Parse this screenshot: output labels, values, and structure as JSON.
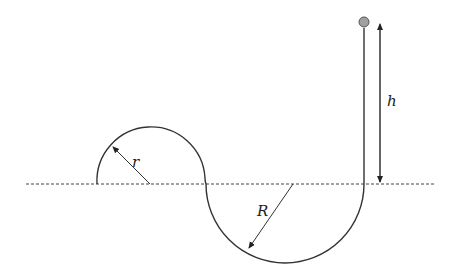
{
  "diagram": {
    "labels": {
      "height": "h",
      "small_radius": "r",
      "large_radius": "R"
    },
    "colors": {
      "line": "#333333",
      "ball_fill": "#a0a0a0",
      "ball_stroke": "#555555",
      "dashed_reference": "#444444"
    },
    "elements": [
      {
        "name": "ball",
        "description": "gray ball at top of vertical track"
      },
      {
        "name": "vertical-track",
        "description": "straight vertical drop"
      },
      {
        "name": "large-semicircle",
        "description": "lower semicircular section of radius R below reference line"
      },
      {
        "name": "small-arc",
        "description": "upper arc of radius r above reference line"
      },
      {
        "name": "reference-line",
        "description": "horizontal dashed line"
      },
      {
        "name": "height-arrow",
        "description": "double-headed arrow showing height h"
      }
    ]
  }
}
